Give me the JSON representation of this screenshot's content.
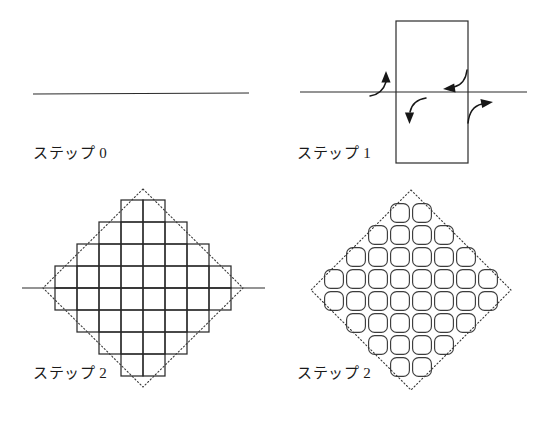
{
  "figure": {
    "background_color": "#ffffff",
    "ink_color": "#2b2b2b",
    "dotted_color": "#3a3a3a",
    "width": 542,
    "height": 432
  },
  "panels": [
    {
      "id": "step0",
      "caption": "ステップ 0",
      "content_type": "horizontal-line",
      "line": {
        "x1": 33,
        "y1": 94,
        "x2": 249,
        "y2": 93
      }
    },
    {
      "id": "step1",
      "caption": "ステップ 1",
      "content_type": "rectangle-on-line-with-arrows",
      "rectangle": {
        "x": 396,
        "y": 21,
        "width": 72,
        "height": 142
      },
      "line": {
        "x1": 300,
        "y1": 92,
        "x2": 527,
        "y2": 92
      },
      "arrows": [
        {
          "name": "arrow-up-left",
          "direction": "up",
          "side": "left-outside"
        },
        {
          "name": "arrow-down-left",
          "direction": "down",
          "side": "left-inside"
        },
        {
          "name": "arrow-left-right",
          "direction": "left",
          "side": "right-inside"
        },
        {
          "name": "arrow-right-right",
          "direction": "right",
          "side": "right-outside"
        }
      ]
    },
    {
      "id": "step2a",
      "caption": "ステップ 2",
      "content_type": "aztec-diamond-square-cells",
      "cell_size": 22,
      "order": 4,
      "diamond": {
        "cx": 143,
        "cy": 288,
        "rx": 100,
        "ry": 99
      },
      "axis_line": {
        "x1": 22,
        "y1": 288,
        "x2": 265,
        "y2": 288
      }
    },
    {
      "id": "step2b",
      "caption": "ステップ 2",
      "content_type": "aztec-diamond-rounded-cells",
      "cell_size": 22,
      "order": 4,
      "corner_radius": 6,
      "diamond": {
        "cx": 411,
        "cy": 290,
        "rx": 100,
        "ry": 100
      }
    }
  ],
  "aztec_rows": {
    "description": "Row widths (in cells) from top to bottom for an order-4 Aztec diamond",
    "widths": [
      2,
      4,
      6,
      8,
      8,
      6,
      4,
      2
    ],
    "offsets": [
      3,
      2,
      1,
      0,
      0,
      1,
      2,
      3
    ]
  },
  "labels": {
    "step0": "ステップ 0",
    "step1": "ステップ 1",
    "step2_left": "ステップ 2",
    "step2_right": "ステップ 2"
  }
}
